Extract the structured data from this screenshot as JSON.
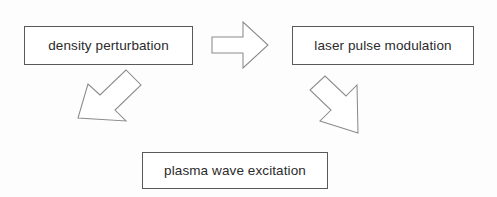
{
  "diagram": {
    "background_color": "#fdfdfd",
    "box_border_color": "#59595b",
    "arrow_stroke_color": "#8b8b8d",
    "text_color": "#2b2b2b",
    "nodes": [
      {
        "id": "density-perturbation",
        "label": "density perturbation",
        "position": "top-left"
      },
      {
        "id": "laser-pulse-modulation",
        "label": "laser pulse modulation",
        "position": "top-right"
      },
      {
        "id": "plasma-wave-excitation",
        "label": "plasma wave excitation",
        "position": "bottom-center"
      }
    ],
    "arrows": [
      {
        "id": "arrow-right",
        "from": "density-perturbation",
        "to": "laser-pulse-modulation",
        "direction": "right"
      },
      {
        "id": "arrow-down-left",
        "from": "laser-pulse-modulation",
        "to": "plasma-wave-excitation",
        "direction": "down-left"
      },
      {
        "id": "arrow-up-left",
        "from": "plasma-wave-excitation",
        "to": "density-perturbation",
        "direction": "up-left"
      }
    ]
  }
}
